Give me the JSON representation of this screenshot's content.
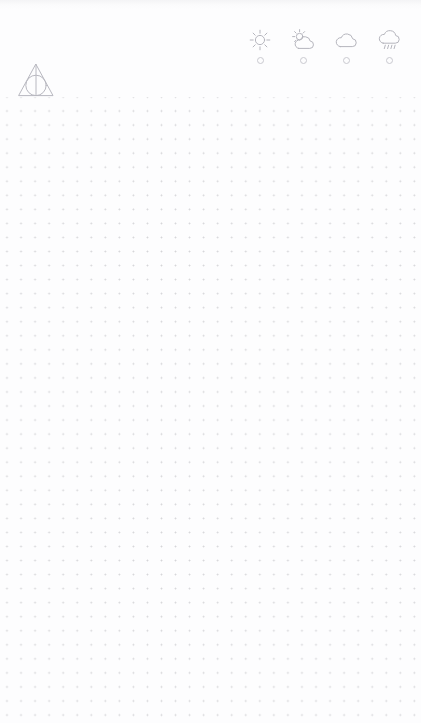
{
  "page": {
    "background_color": "#fdfdfe",
    "width": 421,
    "height": 723
  },
  "logo": {
    "name": "deathly-hallows-symbol",
    "label": "",
    "stroke_color": "#b8b8c0"
  },
  "weather_selector": {
    "stroke_color": "#b5b5bd",
    "radio_color": "#c9c9d0",
    "options": [
      {
        "icon": "sun-icon",
        "label": "",
        "selected": false
      },
      {
        "icon": "sun-behind-cloud-icon",
        "label": "",
        "selected": false
      },
      {
        "icon": "cloud-icon",
        "label": "",
        "selected": false
      },
      {
        "icon": "rain-cloud-icon",
        "label": "",
        "selected": false
      }
    ]
  },
  "dot_grid": {
    "name": "dotted-paper-grid",
    "spacing_px": 14,
    "dot_color": "#96969e",
    "start_y_px": 104,
    "columns": 29,
    "rows": 45
  }
}
